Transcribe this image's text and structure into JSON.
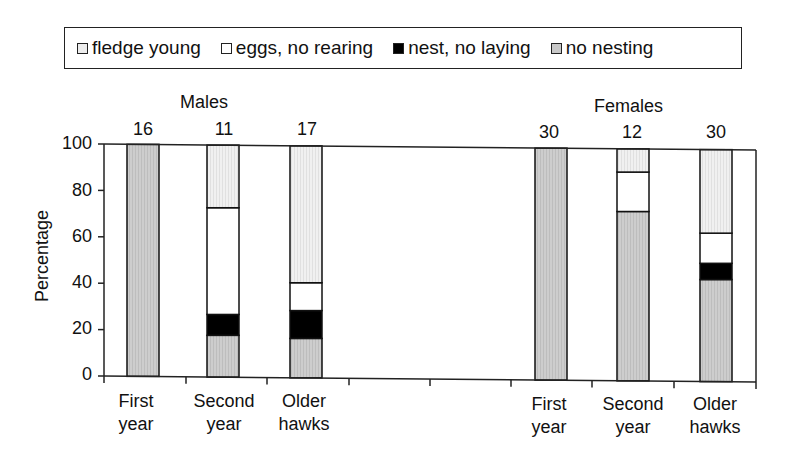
{
  "chart_data": {
    "type": "bar",
    "stacked": true,
    "title": "",
    "ylabel": "Percentage",
    "xlabel": "",
    "ylim": [
      0,
      100
    ],
    "yticks": [
      0,
      20,
      40,
      60,
      80,
      100
    ],
    "legend": {
      "position": "top",
      "entries": [
        "fledge young",
        "eggs, no rearing",
        "nest, no laying",
        "no nesting"
      ]
    },
    "groups": [
      {
        "name": "Males",
        "categories": [
          "First year",
          "Second year",
          "Older hawks"
        ],
        "sample_sizes": [
          16,
          11,
          17
        ]
      },
      {
        "name": "Females",
        "categories": [
          "First year",
          "Second year",
          "Older hawks"
        ],
        "sample_sizes": [
          30,
          12,
          30
        ]
      }
    ],
    "categories": [
      "Males First year",
      "Males Second year",
      "Males Older hawks",
      "Females First year",
      "Females Second year",
      "Females Older hawks"
    ],
    "series": [
      {
        "name": "no nesting",
        "color": "#c8c8c8",
        "values": [
          100,
          18,
          17,
          100,
          73,
          44
        ]
      },
      {
        "name": "nest, no laying",
        "color": "#000000",
        "values": [
          0,
          9,
          12,
          0,
          0,
          7
        ]
      },
      {
        "name": "eggs, no rearing",
        "color": "#ffffff",
        "values": [
          0,
          46,
          12,
          0,
          17,
          13
        ]
      },
      {
        "name": "fledge young",
        "color": "#ececec",
        "values": [
          0,
          27,
          59,
          0,
          10,
          36
        ]
      }
    ],
    "grid": false
  },
  "legend": {
    "items": [
      {
        "label": "fledge young",
        "color": "#ececec"
      },
      {
        "label": "eggs, no rearing",
        "color": "#ffffff"
      },
      {
        "label": "nest, no laying",
        "color": "#000000"
      },
      {
        "label": "no nesting",
        "color": "#c8c8c8"
      }
    ]
  },
  "groups": {
    "males": {
      "title": "Males",
      "n": [
        "16",
        "11",
        "17"
      ]
    },
    "females": {
      "title": "Females",
      "n": [
        "30",
        "12",
        "30"
      ]
    }
  },
  "axis": {
    "ylabel": "Percentage",
    "yticks": [
      "100",
      "80",
      "60",
      "40",
      "20",
      "0"
    ],
    "xlabels": [
      {
        "line1": "First",
        "line2": "year"
      },
      {
        "line1": "Second",
        "line2": "year"
      },
      {
        "line1": "Older",
        "line2": "hawks"
      },
      {
        "line1": "First",
        "line2": "year"
      },
      {
        "line1": "Second",
        "line2": "year"
      },
      {
        "line1": "Older",
        "line2": "hawks"
      }
    ]
  }
}
